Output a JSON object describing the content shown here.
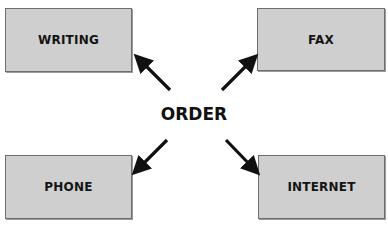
{
  "diagram": {
    "center": {
      "label": "ORDER"
    },
    "nodes": [
      {
        "id": "writing",
        "label": "WRITING",
        "position": "top-left"
      },
      {
        "id": "fax",
        "label": "FAX",
        "position": "top-right"
      },
      {
        "id": "phone",
        "label": "PHONE",
        "position": "bottom-left"
      },
      {
        "id": "internet",
        "label": "INTERNET",
        "position": "bottom-right"
      }
    ],
    "edges": [
      {
        "from": "ORDER",
        "to": "WRITING"
      },
      {
        "from": "ORDER",
        "to": "FAX"
      },
      {
        "from": "ORDER",
        "to": "PHONE"
      },
      {
        "from": "ORDER",
        "to": "INTERNET"
      }
    ],
    "colors": {
      "box_fill": "#cfcfcf",
      "box_border": "#6e6e6e",
      "text": "#141414",
      "arrow": "#111111",
      "background": "#ffffff"
    }
  }
}
